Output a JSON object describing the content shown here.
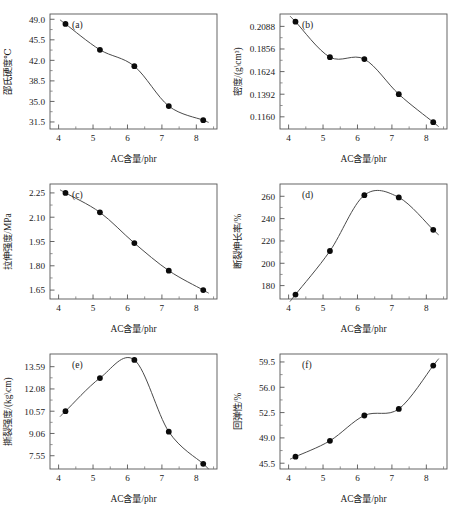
{
  "figure": {
    "x_axis_title": "AC含量/phr",
    "x_ticks": [
      "4",
      "5",
      "6",
      "7",
      "8"
    ],
    "x_range": [
      3.75,
      8.6
    ],
    "marker_color": "#0b0b0b",
    "curve_color": "#4a4a4a",
    "frame_color": "#555555"
  },
  "chart_data": [
    {
      "type": "line",
      "tag": "(a)",
      "title": "",
      "xlabel": "AC含量/phr",
      "ylabel": "邵氏硬度℃",
      "x": [
        4.2,
        5.2,
        6.2,
        7.2,
        8.2
      ],
      "values": [
        48.2,
        43.8,
        41.0,
        34.2,
        31.8
      ],
      "xticks": [
        "4",
        "5",
        "6",
        "7",
        "8"
      ],
      "yticks": [
        "49.0",
        "45.5",
        "42.0",
        "38.5",
        "35.0",
        "31.5"
      ],
      "ytickvals": [
        49.0,
        45.5,
        42.0,
        38.5,
        35.0,
        31.5
      ],
      "xlim": [
        3.75,
        8.6
      ],
      "ylim": [
        30.3,
        49.9
      ],
      "grid": false,
      "legend": "none"
    },
    {
      "type": "line",
      "tag": "(b)",
      "title": "",
      "xlabel": "AC含量/phr",
      "ylabel": "密度/(g\\cm³)",
      "x": [
        4.2,
        5.2,
        6.2,
        7.2,
        8.2
      ],
      "values": [
        0.2136,
        0.1772,
        0.1752,
        0.1392,
        0.1105
      ],
      "xticks": [
        "4",
        "5",
        "6",
        "7",
        "8"
      ],
      "yticks": [
        "0.2088",
        "0.1856",
        "0.1624",
        "0.1392",
        "0.1160"
      ],
      "ytickvals": [
        0.2088,
        0.1856,
        0.1624,
        0.1392,
        0.116
      ],
      "xlim": [
        3.75,
        8.6
      ],
      "ylim": [
        0.1035,
        0.2215
      ],
      "grid": false,
      "legend": "none"
    },
    {
      "type": "line",
      "tag": "(c)",
      "title": "",
      "xlabel": "AC含量/phr",
      "ylabel": "拉伸强度/MPa",
      "x": [
        4.2,
        5.2,
        6.2,
        7.2,
        8.2
      ],
      "values": [
        2.25,
        2.13,
        1.94,
        1.77,
        1.65
      ],
      "xticks": [
        "4",
        "5",
        "6",
        "7",
        "8"
      ],
      "yticks": [
        "2.25",
        "2.10",
        "1.95",
        "1.80",
        "1.65"
      ],
      "ytickvals": [
        2.25,
        2.1,
        1.95,
        1.8,
        1.65
      ],
      "xlim": [
        3.75,
        8.6
      ],
      "ylim": [
        1.595,
        2.305
      ],
      "grid": false,
      "legend": "none"
    },
    {
      "type": "line",
      "tag": "(d)",
      "title": "",
      "xlabel": "AC含量/phr",
      "ylabel": "断裂伸长率/%",
      "x": [
        4.2,
        5.2,
        6.2,
        7.2,
        8.2
      ],
      "values": [
        172,
        211,
        261,
        259,
        230
      ],
      "xticks": [
        "4",
        "5",
        "6",
        "7",
        "8"
      ],
      "yticks": [
        "180",
        "200",
        "220",
        "240",
        "260"
      ],
      "ytickvals": [
        180,
        200,
        220,
        240,
        260
      ],
      "xlim": [
        3.75,
        8.6
      ],
      "ylim": [
        168,
        271
      ],
      "grid": false,
      "legend": "none"
    },
    {
      "type": "line",
      "tag": "(e)",
      "title": "",
      "xlabel": "AC含量/phr",
      "ylabel": "撕裂强度/(kg\\cm)",
      "x": [
        4.2,
        5.2,
        6.2,
        7.2,
        8.2
      ],
      "values": [
        10.57,
        12.82,
        14.05,
        9.18,
        7.0
      ],
      "xticks": [
        "4",
        "5",
        "6",
        "7",
        "8"
      ],
      "yticks": [
        "13.59",
        "12.08",
        "10.57",
        "9.06",
        "7.55"
      ],
      "ytickvals": [
        13.59,
        12.08,
        10.57,
        9.06,
        7.55
      ],
      "xlim": [
        3.75,
        8.6
      ],
      "ylim": [
        6.65,
        14.45
      ],
      "grid": false,
      "legend": "none"
    },
    {
      "type": "line",
      "tag": "(f)",
      "title": "",
      "xlabel": "AC含量/phr",
      "ylabel": "回弹性/%",
      "x": [
        4.2,
        5.2,
        6.2,
        7.2,
        8.2
      ],
      "values": [
        46.4,
        48.6,
        52.1,
        53.0,
        59.0
      ],
      "xticks": [
        "4",
        "5",
        "6",
        "7",
        "8"
      ],
      "yticks": [
        "59.5",
        "56.0",
        "52.5",
        "49.0",
        "45.5"
      ],
      "ytickvals": [
        59.5,
        56.0,
        52.5,
        49.0,
        45.5
      ],
      "xlim": [
        3.75,
        8.6
      ],
      "ylim": [
        44.7,
        60.6
      ],
      "grid": false,
      "legend": "none"
    }
  ]
}
